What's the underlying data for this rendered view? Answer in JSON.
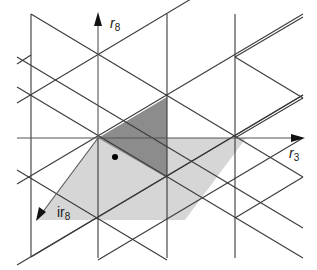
{
  "diagram": {
    "type": "hexagonal lattice / triangular tiling with root vectors",
    "colors": {
      "background": "#ffffff",
      "line": "#3a3a3a",
      "axis": "#555555",
      "dark_triangle": "#8c8c8c",
      "light_region": "#d6d6d6",
      "dot": "#000000"
    },
    "labels": {
      "r8": {
        "base": "r",
        "sub": "8"
      },
      "r3": {
        "base": "r",
        "sub": "3"
      },
      "ir8": {
        "base": "ir",
        "sub": "8"
      }
    },
    "origin": [
      98,
      138
    ],
    "dot": [
      115,
      157
    ],
    "vertical_lines_x": [
      31,
      98,
      167,
      235
    ],
    "light_region_polygon": [
      [
        98,
        138
      ],
      [
        246,
        138
      ],
      [
        185,
        220
      ],
      [
        37,
        220
      ]
    ],
    "dark_triangle_polygon": [
      [
        98,
        138
      ],
      [
        167,
        97
      ],
      [
        167,
        178
      ]
    ],
    "arrows": [
      {
        "name": "r8",
        "from": [
          98,
          138
        ],
        "to": [
          98,
          14
        ]
      },
      {
        "name": "r3",
        "from": [
          98,
          138
        ],
        "to": [
          303,
          138
        ]
      },
      {
        "name": "ir8",
        "from": [
          98,
          138
        ],
        "to": [
          37,
          220
        ]
      }
    ]
  }
}
